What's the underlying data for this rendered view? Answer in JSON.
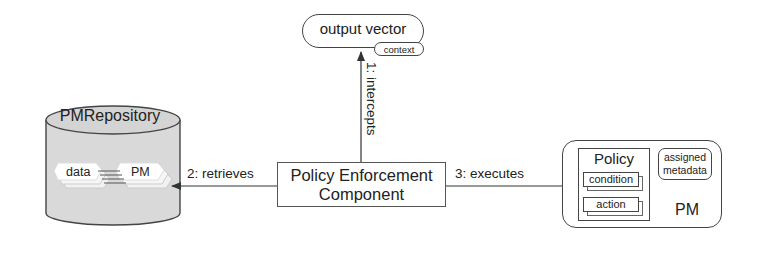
{
  "diagram": {
    "nodes": {
      "output_vector": {
        "label": "output vector",
        "badge": "context"
      },
      "policy_enforcement": {
        "line1": "Policy Enforcement",
        "line2": "Component"
      },
      "repository": {
        "label": "PMRepository",
        "items": [
          "data",
          "PM"
        ]
      },
      "pm": {
        "label": "PM",
        "policy": {
          "title": "Policy",
          "parts": [
            "condition",
            "action"
          ]
        },
        "metadata": {
          "line1": "assigned",
          "line2": "metadata"
        }
      }
    },
    "edges": [
      {
        "label": "1: intercepts",
        "from": "Policy Enforcement Component",
        "to": "output vector"
      },
      {
        "label": "2: retrieves",
        "from": "Policy Enforcement Component",
        "to": "PMRepository"
      },
      {
        "label": "3: executes",
        "from": "Policy Enforcement Component",
        "to": "PM"
      }
    ]
  },
  "colors": {
    "stroke": "#444444",
    "cylinder_fill": "#d9d9d9",
    "background": "#ffffff"
  }
}
